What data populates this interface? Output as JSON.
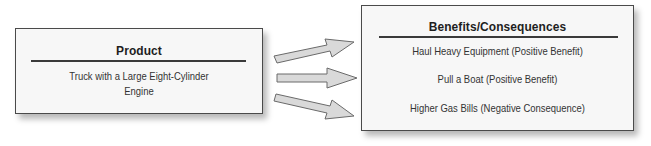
{
  "product": {
    "title": "Product",
    "description_line1": "Truck with a Large Eight-Cylinder",
    "description_line2": "Engine"
  },
  "benefits": {
    "title": "Benefits/Consequences",
    "items": [
      {
        "label": "Haul Heavy Equipment (Positive Benefit)"
      },
      {
        "label": "Pull a Boat (Positive Benefit)"
      },
      {
        "label": "Higher Gas Bills (Negative Consequence)"
      }
    ]
  },
  "arrows": [
    {
      "name": "arrow-to-haul-heavy-equipment"
    },
    {
      "name": "arrow-to-pull-a-boat"
    },
    {
      "name": "arrow-to-higher-gas-bills"
    }
  ],
  "colors": {
    "box_fill": "#f7f7f7",
    "box_border": "#4a4a4a",
    "arrow_fill": "#d9d9d9",
    "arrow_stroke": "#6a6a6a"
  }
}
